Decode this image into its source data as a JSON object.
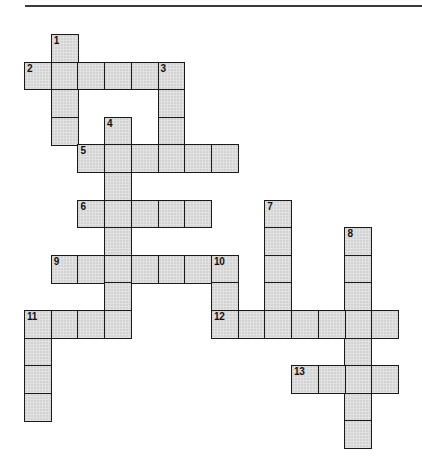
{
  "puzzle": {
    "title": "",
    "grid_origin": {
      "x": 24,
      "y": 34
    },
    "cell_size": {
      "w": 26.7,
      "h": 27.6
    },
    "colors": {
      "cell_fill": "#e2e2e2",
      "cell_border": "#1a1a1a",
      "background": "#ffffff",
      "rule": "#3a3a3a"
    },
    "entries": [
      {
        "number": "1",
        "direction": "down",
        "row": 0,
        "col": 1,
        "length": 4
      },
      {
        "number": "2",
        "direction": "across",
        "row": 1,
        "col": 0,
        "length": 6
      },
      {
        "number": "3",
        "direction": "down",
        "row": 1,
        "col": 5,
        "length": 4
      },
      {
        "number": "4",
        "direction": "down",
        "row": 3,
        "col": 3,
        "length": 8
      },
      {
        "number": "5",
        "direction": "across",
        "row": 4,
        "col": 2,
        "length": 6
      },
      {
        "number": "6",
        "direction": "across",
        "row": 6,
        "col": 2,
        "length": 5
      },
      {
        "number": "7",
        "direction": "down",
        "row": 6,
        "col": 9,
        "length": 5
      },
      {
        "number": "8",
        "direction": "down",
        "row": 7,
        "col": 12,
        "length": 8
      },
      {
        "number": "9",
        "direction": "across",
        "row": 8,
        "col": 1,
        "length": 7
      },
      {
        "number": "10",
        "direction": "down",
        "row": 8,
        "col": 7,
        "length": 3
      },
      {
        "number": "11",
        "direction": "across",
        "row": 10,
        "col": 0,
        "length": 4
      },
      {
        "number": "11",
        "direction": "down",
        "row": 10,
        "col": 0,
        "length": 4
      },
      {
        "number": "12",
        "direction": "across",
        "row": 10,
        "col": 7,
        "length": 7
      },
      {
        "number": "13",
        "direction": "across",
        "row": 12,
        "col": 10,
        "length": 4
      }
    ]
  }
}
